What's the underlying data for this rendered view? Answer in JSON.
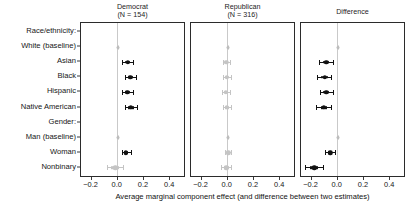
{
  "figure": {
    "axis_title": "Average marginal component effect (and difference between two estimates)",
    "row_group_labels": [
      "Race/ethnicity:",
      "Gender:"
    ]
  },
  "rows": [
    {
      "label": "Race/ethnicity:",
      "type": "header"
    },
    {
      "label": "White (baseline)",
      "type": "item"
    },
    {
      "label": "Asian",
      "type": "item"
    },
    {
      "label": "Black",
      "type": "item"
    },
    {
      "label": "Hispanic",
      "type": "item"
    },
    {
      "label": "Native American",
      "type": "item"
    },
    {
      "label": "Gender:",
      "type": "header"
    },
    {
      "label": "Man (baseline)",
      "type": "item"
    },
    {
      "label": "Woman",
      "type": "item"
    },
    {
      "label": "Nonbinary",
      "type": "item"
    }
  ],
  "panels": [
    {
      "title": "Democrat\n(N = 154)",
      "name": "democrat"
    },
    {
      "title": "Republican\n(N = 316)",
      "name": "republican"
    },
    {
      "title": "Difference",
      "name": "difference"
    }
  ],
  "xaxis": {
    "min": -0.28,
    "max": 0.52,
    "ticks": [
      -0.2,
      0.0,
      0.2,
      0.4
    ],
    "tick_labels": [
      "−0.2",
      "0.0",
      "0.2",
      "0.4"
    ]
  },
  "colors": {
    "estimate": "#111111",
    "baseline": "#bdbdbd",
    "faint": "#c4c4c4",
    "zeroline": "#c9c9c9",
    "axis": "#2b2b2b"
  },
  "chart_data": {
    "type": "scatter",
    "title": "",
    "subtitle": "",
    "xlabel": "Average marginal component effect (and difference between two estimates)",
    "ylabel": "",
    "xlim": [
      -0.28,
      0.52
    ],
    "xticks": [
      -0.2,
      0.0,
      0.2,
      0.4
    ],
    "grid": false,
    "legend": "none",
    "annotations": [
      "Zero reference line drawn in each panel"
    ],
    "categories": [
      "Race/ethnicity:",
      "White (baseline)",
      "Asian",
      "Black",
      "Hispanic",
      "Native American",
      "Gender:",
      "Man (baseline)",
      "Woman",
      "Nonbinary"
    ],
    "series": [
      {
        "name": "Democrat (N = 154)",
        "points": [
          {
            "category": "White (baseline)",
            "estimate": 0.0,
            "low": 0.0,
            "high": 0.0,
            "style": "baseline"
          },
          {
            "category": "Asian",
            "estimate": 0.075,
            "low": 0.035,
            "high": 0.118,
            "style": "estimate"
          },
          {
            "category": "Black",
            "estimate": 0.095,
            "low": 0.052,
            "high": 0.14,
            "style": "estimate"
          },
          {
            "category": "Hispanic",
            "estimate": 0.072,
            "low": 0.032,
            "high": 0.115,
            "style": "estimate"
          },
          {
            "category": "Native American",
            "estimate": 0.1,
            "low": 0.052,
            "high": 0.15,
            "style": "estimate"
          },
          {
            "category": "Man (baseline)",
            "estimate": 0.0,
            "low": 0.0,
            "high": 0.0,
            "style": "baseline"
          },
          {
            "category": "Woman",
            "estimate": 0.062,
            "low": 0.03,
            "high": 0.098,
            "style": "estimate"
          },
          {
            "category": "Nonbinary",
            "estimate": -0.02,
            "low": -0.082,
            "high": 0.042,
            "style": "faint"
          }
        ]
      },
      {
        "name": "Republican (N = 316)",
        "points": [
          {
            "category": "White (baseline)",
            "estimate": 0.0,
            "low": 0.0,
            "high": 0.0,
            "style": "baseline"
          },
          {
            "category": "Asian",
            "estimate": -0.012,
            "low": -0.04,
            "high": 0.016,
            "style": "faint"
          },
          {
            "category": "Black",
            "estimate": -0.005,
            "low": -0.033,
            "high": 0.024,
            "style": "faint"
          },
          {
            "category": "Hispanic",
            "estimate": -0.014,
            "low": -0.044,
            "high": 0.016,
            "style": "faint"
          },
          {
            "category": "Native American",
            "estimate": -0.006,
            "low": -0.038,
            "high": 0.026,
            "style": "faint"
          },
          {
            "category": "Man (baseline)",
            "estimate": 0.0,
            "low": 0.0,
            "high": 0.0,
            "style": "baseline"
          },
          {
            "category": "Woman",
            "estimate": 0.004,
            "low": -0.018,
            "high": 0.026,
            "style": "faint"
          },
          {
            "category": "Nonbinary",
            "estimate": -0.01,
            "low": -0.048,
            "high": 0.028,
            "style": "faint"
          }
        ]
      },
      {
        "name": "Difference",
        "points": [
          {
            "category": "White (baseline)",
            "estimate": 0.0,
            "low": 0.0,
            "high": 0.0,
            "style": "baseline"
          },
          {
            "category": "Asian",
            "estimate": -0.088,
            "low": -0.14,
            "high": -0.038,
            "style": "estimate"
          },
          {
            "category": "Black",
            "estimate": -0.1,
            "low": -0.155,
            "high": -0.048,
            "style": "estimate"
          },
          {
            "category": "Hispanic",
            "estimate": -0.086,
            "low": -0.138,
            "high": -0.036,
            "style": "estimate"
          },
          {
            "category": "Native American",
            "estimate": -0.106,
            "low": -0.162,
            "high": -0.05,
            "style": "estimate"
          },
          {
            "category": "Man (baseline)",
            "estimate": 0.0,
            "low": 0.0,
            "high": 0.0,
            "style": "baseline"
          },
          {
            "category": "Woman",
            "estimate": -0.058,
            "low": -0.098,
            "high": -0.018,
            "style": "estimate"
          },
          {
            "category": "Nonbinary",
            "estimate": -0.18,
            "low": -0.25,
            "high": -0.112,
            "style": "estimate"
          }
        ]
      }
    ]
  }
}
